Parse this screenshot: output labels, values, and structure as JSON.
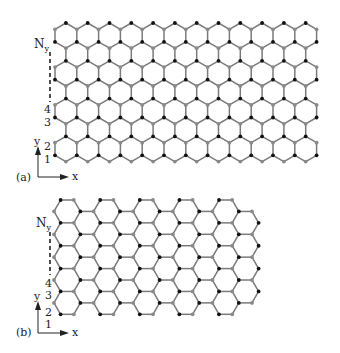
{
  "figure": {
    "panels": [
      {
        "id": "a",
        "label": "(a)",
        "edge_type": "zigzag",
        "row_labels": [
          "1",
          "2",
          "3",
          "4"
        ],
        "top_row_label": "N",
        "top_row_subscript": "y",
        "axis_x_label": "x",
        "axis_y_label": "y"
      },
      {
        "id": "b",
        "label": "(b)",
        "edge_type": "armchair",
        "row_labels": [
          "1",
          "2",
          "3",
          "4"
        ],
        "top_row_label": "N",
        "top_row_subscript": "y",
        "axis_x_label": "x",
        "axis_y_label": "y"
      }
    ],
    "colors": {
      "bond": "#7a7a7a",
      "atom_a": "#111111",
      "atom_b": "#8a8a8a",
      "text": "#222222"
    }
  }
}
